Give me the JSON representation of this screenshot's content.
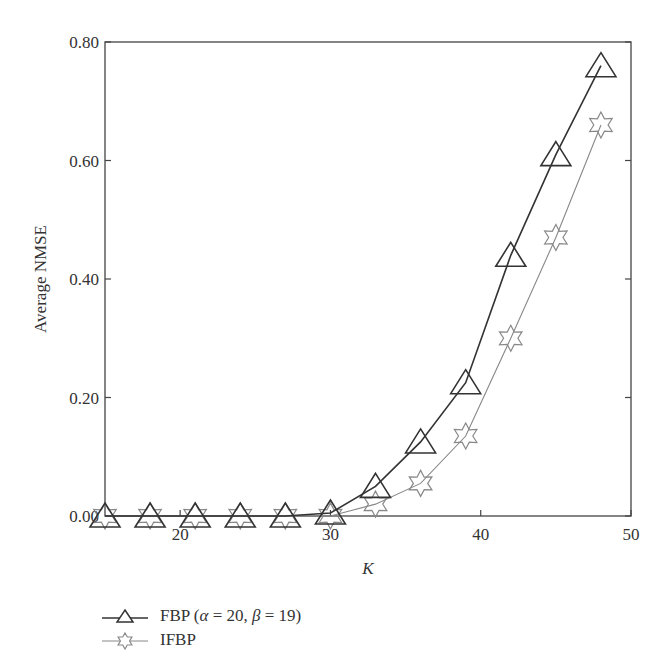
{
  "chart_data": {
    "type": "line",
    "title": "",
    "xlabel": "K",
    "ylabel": "Average NMSE",
    "xlim": [
      15,
      50
    ],
    "ylim": [
      0,
      0.8
    ],
    "xticks": [
      20,
      30,
      40,
      50
    ],
    "yticks": [
      "0.00",
      "0.20",
      "0.40",
      "0.60",
      "0.80"
    ],
    "grid": false,
    "legend_position": "below",
    "x": [
      15,
      18,
      21,
      24,
      27,
      30,
      33,
      36,
      39,
      42,
      45,
      48
    ],
    "series": [
      {
        "name": "FBP (α = 20, β = 19)",
        "marker": "triangle",
        "color": "#333333",
        "values": [
          0.0,
          0.0,
          0.0,
          0.0,
          0.0,
          0.005,
          0.05,
          0.125,
          0.225,
          0.44,
          0.61,
          0.76
        ]
      },
      {
        "name": "IFBP",
        "marker": "hexagram",
        "color": "#888888",
        "values": [
          0.0,
          0.0,
          0.0,
          0.0,
          0.0,
          0.0,
          0.02,
          0.055,
          0.135,
          0.3,
          0.47,
          0.66
        ]
      }
    ]
  },
  "legend": {
    "fbp_prefix": "FBP (",
    "fbp_alpha": "α",
    "fbp_mid": " = 20, ",
    "fbp_beta": "β",
    "fbp_suffix": " = 19)",
    "ifbp": "IFBP"
  }
}
